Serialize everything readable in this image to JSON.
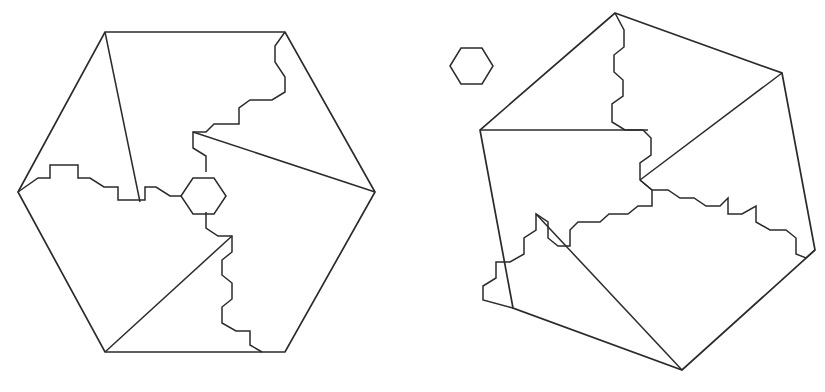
{
  "figure": {
    "background_color": "#ffffff",
    "stroke_color": "#2b2b2b",
    "stroke_width": 1.7,
    "canvas": {
      "width": 825,
      "height": 392
    }
  },
  "shapes": {
    "left_hexagon": {
      "name": "left-hexagon-outline",
      "label": "Left regular hexagon",
      "points": "105,32 285,32 375,192 285,352 105,352 18,192"
    },
    "left_cut_a": {
      "name": "left-cut-line-a",
      "label": "Left figure interior cut, upper-left triangle edge",
      "points": "105,32 140,202"
    },
    "left_cut_b": {
      "name": "left-cut-line-b",
      "label": "Left figure interior cut, stepped left-band",
      "points": "18,192 38,178 50,178 50,165 78,165 78,178 90,178 104,187 118,187 118,200 145,200 145,187 156,187 170,196 181,196"
    },
    "left_cut_c": {
      "name": "left-cut-line-c",
      "label": "Left figure interior cut, upper zig-zag from top-right vertex",
      "points": "285,32 275,46 275,62 285,77 285,92 272,100 250,100 239,108 239,124 214,124 206,132 193,132 193,148 206,156 206,172"
    },
    "left_cut_d": {
      "name": "left-cut-line-d",
      "label": "Left figure interior cut, diagonal to right vertex",
      "points": "193,132 375,192"
    },
    "left_cut_e": {
      "name": "left-cut-line-e",
      "label": "Left figure interior cut, lower zig-zag",
      "points": "206,212 206,228 218,236 232,236 232,252 222,260 222,275 232,283 232,299 222,307 222,323 236,331 250,331 250,345 262,352"
    },
    "left_cut_f": {
      "name": "left-cut-line-f",
      "label": "Left figure interior cut, diagonal from bottom-left vertex",
      "points": "105,352 232,236"
    },
    "left_center_hexagon": {
      "name": "left-center-hexagon",
      "label": "Central small hexagon inside left figure",
      "points": "181,196 193,178 214,178 226,196 214,214 193,214"
    },
    "small_hexagon": {
      "name": "standalone-small-hexagon",
      "label": "Small separate hexagon between the two figures",
      "points": "450,66 461,48 482,48 493,66 482,84 461,84"
    },
    "right_hexagon": {
      "name": "right-hexagon-outline",
      "label": "Right rotated hexagon",
      "points": "615,13 782,73 815,250 682,370 513,308 480,130"
    },
    "right_cut_a": {
      "name": "right-cut-line-a",
      "label": "Right figure interior cut, upper zig-zag from top vertex",
      "points": "615,13 624,30 624,47 614,55 614,72 623,80 623,96 612,104 612,122 625,130 643,130 651,138 651,155 640,163 640,180"
    },
    "right_cut_b": {
      "name": "right-cut-line-b",
      "label": "Right figure interior cut, horizontal chord",
      "points": "480,130 648,130"
    },
    "right_cut_c": {
      "name": "right-cut-line-c",
      "label": "Right figure interior cut, diagonal to right vertex",
      "points": "782,73 640,180"
    },
    "right_cut_d": {
      "name": "right-cut-line-d",
      "label": "Right figure interior cut, lower-middle zig-zag",
      "points": "640,180 652,190 652,206 638,206 628,214 609,214 600,222 578,222 570,230 570,246 558,246 548,238 548,222 536,214 536,230 524,238 524,254 510,262 496,262 496,278 483,286 483,300 513,308"
    },
    "right_cut_e": {
      "name": "right-cut-line-e",
      "label": "Right figure interior cut, diagonal from bottom vertex",
      "points": "682,370 536,214"
    },
    "right_cut_f": {
      "name": "right-cut-line-f",
      "label": "Right figure interior cut, right stepped band",
      "points": "640,180 652,190 668,190 680,198 694,198 706,206 720,206 728,198 728,214 742,214 756,206 756,222 770,230 786,230 796,238 796,254 806,258 815,250"
    },
    "right_cut_g": {
      "name": "right-cut-line-g",
      "label": "Right figure interior cut, stepped band lower trace",
      "points": "700,214 728,214 728,198 760,198 760,214 790,214 790,230 815,244"
    }
  }
}
